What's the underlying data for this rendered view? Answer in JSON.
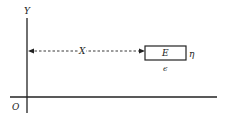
{
  "diagram": {
    "axes": {
      "y_label": "Y",
      "origin_label": "O"
    },
    "distance_label": "X",
    "box": {
      "label": "E",
      "right_label": "η",
      "below_label": "ϵ"
    },
    "colors": {
      "line": "#222222",
      "background": "#ffffff"
    }
  }
}
